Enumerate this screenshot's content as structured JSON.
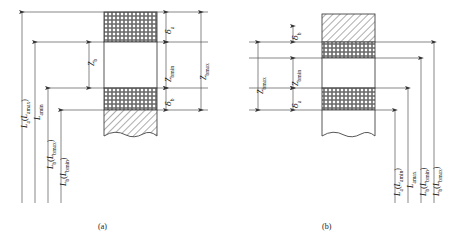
{
  "figure": {
    "type": "engineering-dimension-diagram",
    "panels": [
      {
        "id": "a",
        "caption": "(a)",
        "left_dimensions": [
          {
            "name": "L_a(L_amax)",
            "base": "L",
            "sub": "a",
            "paren_base": "L",
            "paren_sub": "amax",
            "text": "La(Lamax)"
          },
          {
            "name": "L_amin",
            "base": "L",
            "sub": "amin",
            "text": "Lamin"
          },
          {
            "name": "L_b(L_bmax)",
            "base": "L",
            "sub": "b",
            "paren_base": "L",
            "paren_sub": "bmax",
            "text": "Lb(Lbmax)"
          },
          {
            "name": "L_b(L_bmin)",
            "base": "L",
            "sub": "b",
            "paren_base": "L",
            "paren_sub": "bmin",
            "text": "Lb(Lbmin)"
          }
        ],
        "inner_dimension": {
          "name": "Z_b",
          "base": "Z",
          "sub": "b",
          "text": "Zb"
        },
        "right_dimensions": [
          {
            "name": "delta_a",
            "base": "δ",
            "sub": "a",
            "text": "δa"
          },
          {
            "name": "Z_bmin",
            "base": "Z",
            "sub": "bmin",
            "text": "Zbmin"
          },
          {
            "name": "delta_b",
            "base": "δ",
            "sub": "b",
            "text": "δb"
          },
          {
            "name": "Z_bmax",
            "base": "Z",
            "sub": "bmax",
            "text": "Zbmax"
          }
        ]
      },
      {
        "id": "b",
        "caption": "(b)",
        "left_dimensions": [
          {
            "name": "delta_b",
            "base": "δ",
            "sub": "b",
            "text": "δb"
          },
          {
            "name": "Z_bmin",
            "base": "Z",
            "sub": "bmin",
            "text": "Zbmin"
          },
          {
            "name": "Z_bmax",
            "base": "Z",
            "sub": "bmax",
            "text": "Zbmax"
          },
          {
            "name": "delta_a",
            "base": "δ",
            "sub": "a",
            "text": "δa"
          }
        ],
        "right_dimensions": [
          {
            "name": "L_a(L_amin)",
            "base": "L",
            "sub": "a",
            "paren_base": "L",
            "paren_sub": "amin",
            "text": "La(Lamin)"
          },
          {
            "name": "L_amax",
            "base": "L",
            "sub": "amax",
            "text": "Lamax"
          },
          {
            "name": "L_b(L_bmin)",
            "base": "L",
            "sub": "b",
            "paren_base": "L",
            "paren_sub": "bmin",
            "text": "Lb(Lbmin)"
          },
          {
            "name": "L_b(L_bmax)",
            "base": "L",
            "sub": "b",
            "paren_base": "L",
            "paren_sub": "bmax",
            "text": "Lb(Lbmax)"
          }
        ]
      }
    ],
    "colors": {
      "line": "#3a3a3a",
      "hatch": "#555555",
      "text": "#111111",
      "background": "#ffffff"
    },
    "hatch_styles": [
      "cross-hatch",
      "diagonal-hatch"
    ]
  }
}
